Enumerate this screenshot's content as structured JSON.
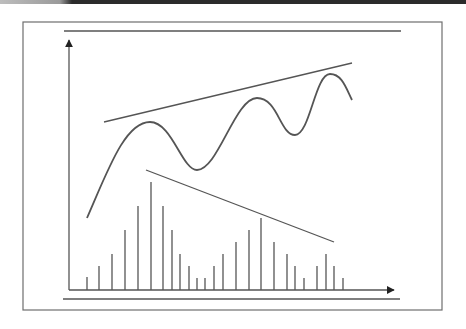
{
  "diagram": {
    "type": "technical-analysis-divergence",
    "colors": {
      "stroke": "#555555",
      "frame": "#6e6e6e",
      "topbar": "#2b2b2b",
      "background": "#ffffff"
    },
    "frame": {
      "x": 23,
      "y": 22,
      "width": 419,
      "height": 288
    },
    "top_rule": {
      "x1": 64,
      "y1": 31,
      "x2": 401,
      "y2": 31
    },
    "bottom_rule": {
      "x1": 63,
      "y1": 299,
      "x2": 400,
      "y2": 299
    },
    "y_axis": {
      "x": 69,
      "y_top": 40,
      "y_bottom": 290
    },
    "x_axis": {
      "y": 290,
      "x_left": 69,
      "x_right": 394
    },
    "price_curve": {
      "points": [
        [
          87,
          218
        ],
        [
          150,
          122
        ],
        [
          197,
          170
        ],
        [
          257,
          98
        ],
        [
          295,
          135
        ],
        [
          330,
          74
        ],
        [
          352,
          100
        ]
      ],
      "path": "M87,218 C108,170 125,122 150,122 C172,122 182,170 197,170 C218,170 235,98 257,98 C278,98 280,135 295,135 C310,135 315,74 330,74 C342,74 346,88 352,100"
    },
    "upper_trend_line": {
      "x1": 104,
      "y1": 122,
      "x2": 352,
      "y2": 63
    },
    "lower_trend_line": {
      "x1": 146,
      "y1": 170,
      "x2": 334,
      "y2": 242
    },
    "volume_bars": [
      {
        "x": 87,
        "top": 277
      },
      {
        "x": 99,
        "top": 266
      },
      {
        "x": 112,
        "top": 254
      },
      {
        "x": 125,
        "top": 230
      },
      {
        "x": 138,
        "top": 206
      },
      {
        "x": 151,
        "top": 182
      },
      {
        "x": 163,
        "top": 206
      },
      {
        "x": 172,
        "top": 230
      },
      {
        "x": 180,
        "top": 254
      },
      {
        "x": 189,
        "top": 266
      },
      {
        "x": 197,
        "top": 278
      },
      {
        "x": 205,
        "top": 278
      },
      {
        "x": 214,
        "top": 266
      },
      {
        "x": 223,
        "top": 254
      },
      {
        "x": 236,
        "top": 242
      },
      {
        "x": 249,
        "top": 230
      },
      {
        "x": 261,
        "top": 218
      },
      {
        "x": 274,
        "top": 242
      },
      {
        "x": 287,
        "top": 254
      },
      {
        "x": 295,
        "top": 266
      },
      {
        "x": 304,
        "top": 278
      },
      {
        "x": 317,
        "top": 266
      },
      {
        "x": 326,
        "top": 254
      },
      {
        "x": 334,
        "top": 266
      },
      {
        "x": 343,
        "top": 278
      }
    ]
  }
}
